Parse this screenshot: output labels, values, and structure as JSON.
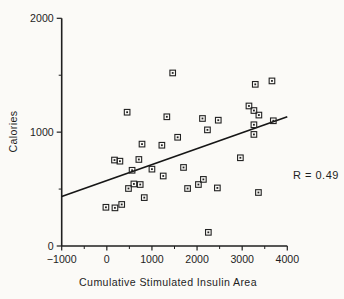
{
  "colors": {
    "ink": "#1f1f1f",
    "background": "#fbfaf7",
    "marker": "#222222",
    "line": "#161616"
  },
  "chart_data": {
    "type": "scatter",
    "title": "",
    "xlabel": "Cumulative Stimulated Insulin Area",
    "ylabel": "Calories",
    "xlim": [
      -1000,
      4000
    ],
    "ylim": [
      0,
      2000
    ],
    "x_major_ticks": [
      -1000,
      0,
      1000,
      2000,
      3000,
      4000
    ],
    "x_minor_ticks": [
      -500,
      500,
      1500,
      2500,
      3500
    ],
    "y_major_ticks": [
      0,
      1000,
      2000
    ],
    "y_minor_ticks": [
      500,
      1500
    ],
    "grid": false,
    "legend": "none",
    "marker_style": "open-square-with-center-dot",
    "annotation": "R = 0.49",
    "regression_line": {
      "x1": -1000,
      "y1": 435,
      "x2": 4000,
      "y2": 1135
    },
    "points": [
      [
        -20,
        340
      ],
      [
        170,
        755
      ],
      [
        180,
        335
      ],
      [
        290,
        745
      ],
      [
        330,
        365
      ],
      [
        450,
        1175
      ],
      [
        480,
        505
      ],
      [
        560,
        665
      ],
      [
        600,
        545
      ],
      [
        710,
        760
      ],
      [
        740,
        540
      ],
      [
        780,
        895
      ],
      [
        830,
        425
      ],
      [
        1000,
        675
      ],
      [
        1220,
        885
      ],
      [
        1250,
        615
      ],
      [
        1330,
        1135
      ],
      [
        1460,
        1520
      ],
      [
        1570,
        955
      ],
      [
        1700,
        690
      ],
      [
        1790,
        505
      ],
      [
        2030,
        540
      ],
      [
        2120,
        1120
      ],
      [
        2140,
        585
      ],
      [
        2230,
        1020
      ],
      [
        2250,
        120
      ],
      [
        2450,
        510
      ],
      [
        2470,
        1105
      ],
      [
        2960,
        775
      ],
      [
        3150,
        1230
      ],
      [
        3260,
        1190
      ],
      [
        3260,
        1065
      ],
      [
        3260,
        980
      ],
      [
        3290,
        1420
      ],
      [
        3360,
        470
      ],
      [
        3370,
        1150
      ],
      [
        3660,
        1450
      ],
      [
        3690,
        1100
      ]
    ]
  }
}
